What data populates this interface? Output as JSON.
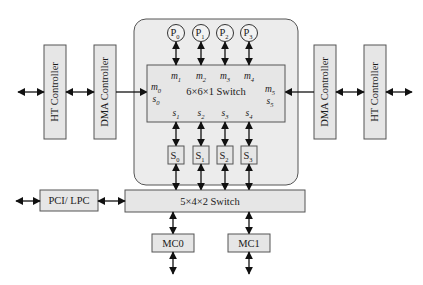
{
  "left": {
    "ht_controller": "HT Controller",
    "dma_controller": "DMA Controller"
  },
  "right": {
    "dma_controller": "DMA Controller",
    "ht_controller": "HT Controller"
  },
  "processors": [
    {
      "base": "P",
      "sub": "0"
    },
    {
      "base": "P",
      "sub": "1"
    },
    {
      "base": "P",
      "sub": "2"
    },
    {
      "base": "P",
      "sub": "3"
    }
  ],
  "main_switch": {
    "label": "6×6×1  Switch",
    "master_ports": [
      {
        "base": "m",
        "sub": "0"
      },
      {
        "base": "m",
        "sub": "1"
      },
      {
        "base": "m",
        "sub": "2"
      },
      {
        "base": "m",
        "sub": "3"
      },
      {
        "base": "m",
        "sub": "4"
      },
      {
        "base": "m",
        "sub": "5"
      }
    ],
    "slave_ports": [
      {
        "base": "s",
        "sub": "0"
      },
      {
        "base": "s",
        "sub": "1"
      },
      {
        "base": "s",
        "sub": "2"
      },
      {
        "base": "s",
        "sub": "3"
      },
      {
        "base": "s",
        "sub": "4"
      },
      {
        "base": "s",
        "sub": "5"
      }
    ]
  },
  "slave_blocks": [
    {
      "base": "S",
      "sub": "0"
    },
    {
      "base": "S",
      "sub": "1"
    },
    {
      "base": "S",
      "sub": "2"
    },
    {
      "base": "S",
      "sub": "3"
    }
  ],
  "bottom_switch": {
    "label": "5×4×2  Switch"
  },
  "pci_lpc": "PCI/ LPC",
  "memory_controllers": [
    "MC0",
    "MC1"
  ]
}
